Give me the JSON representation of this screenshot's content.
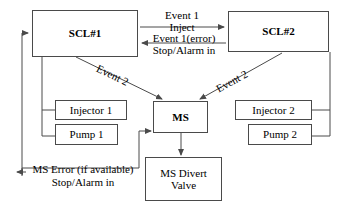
{
  "diagram": {
    "background_color": "#ffffff",
    "line_color": "#4a4a4a",
    "text_color": "#000000",
    "nodes": [
      {
        "id": "scl1",
        "label": "SCL#1"
      },
      {
        "id": "scl2",
        "label": "SCL#2"
      },
      {
        "id": "injector1",
        "label": "Injector 1"
      },
      {
        "id": "pump1",
        "label": "Pump 1"
      },
      {
        "id": "ms",
        "label": "MS"
      },
      {
        "id": "injector2",
        "label": "Injector 2"
      },
      {
        "id": "pump2",
        "label": "Pump 2"
      },
      {
        "id": "divert",
        "label": "MS Divert\nValve",
        "line1": "MS Divert",
        "line2": "Valve"
      }
    ],
    "edge_labels": {
      "event1": "Event 1",
      "inject": "Inject",
      "event1_error": "Event 1(error)",
      "stop_alarm_in_top": "Stop/Alarm in",
      "event2_left": "Event 2",
      "event2_right": "Event 2",
      "ms_error": "MS Error (if available)",
      "stop_alarm_in_bottom": "Stop/Alarm in"
    }
  }
}
